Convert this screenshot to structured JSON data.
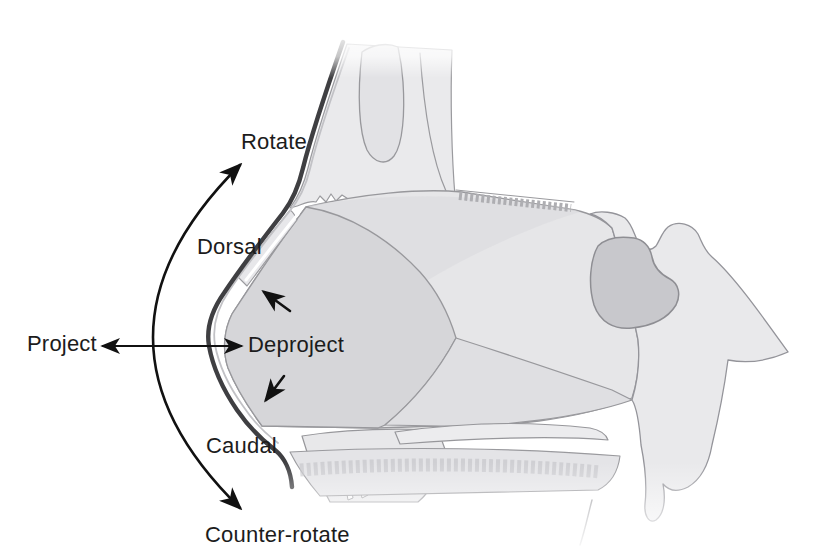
{
  "figure": {
    "labels": {
      "rotate": "Rotate",
      "dorsal": "Dorsal",
      "project": "Project",
      "deproject": "Deproject",
      "caudal": "Caudal",
      "counter_rotate": "Counter-rotate"
    },
    "colors": {
      "background": "#ffffff",
      "label_text": "#1c1c1c",
      "arrow": "#111111",
      "skin_profile_line": "#3f3f42",
      "bone_fill": "#eaeaec",
      "cartilage_fill": "#d6d6d9",
      "sphenoid_sinus_fill": "#c8c8cc",
      "outline": "#95959a"
    }
  }
}
